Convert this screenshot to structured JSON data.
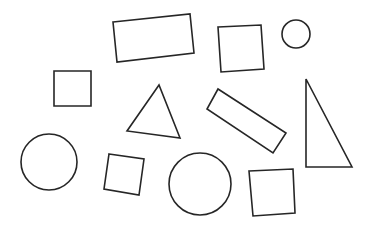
{
  "canvas": {
    "width": 372,
    "height": 231,
    "background": "#ffffff",
    "stroke": "#262626"
  },
  "shapes": [
    {
      "id": "top-rectangle",
      "kind": "rectangle",
      "points": "113,22 190,14 194,53 117,62"
    },
    {
      "id": "top-right-square",
      "kind": "square",
      "points": "218,27 261,25 264,69 221,72"
    },
    {
      "id": "small-circle",
      "kind": "circle",
      "cx": 296,
      "cy": 34,
      "r": 14
    },
    {
      "id": "left-square",
      "kind": "square",
      "points": "54,71 91,71 91,106 54,106"
    },
    {
      "id": "center-triangle",
      "kind": "triangle",
      "points": "159,85 127,131 180,138"
    },
    {
      "id": "tilted-rectangle",
      "kind": "rectangle",
      "points": "218,89 207,109 273,153 286,133"
    },
    {
      "id": "right-triangle",
      "kind": "triangle",
      "points": "306,79 306,167 352,167"
    },
    {
      "id": "left-circle",
      "kind": "circle",
      "cx": 49,
      "cy": 162,
      "r": 28
    },
    {
      "id": "small-tilted-square",
      "kind": "square",
      "points": "109,154 144,159 139,195 104,189"
    },
    {
      "id": "bottom-circle",
      "kind": "circle",
      "cx": 200,
      "cy": 184,
      "r": 31
    },
    {
      "id": "bottom-right-square",
      "kind": "square",
      "points": "249,171 293,169 295,213 253,216"
    }
  ]
}
